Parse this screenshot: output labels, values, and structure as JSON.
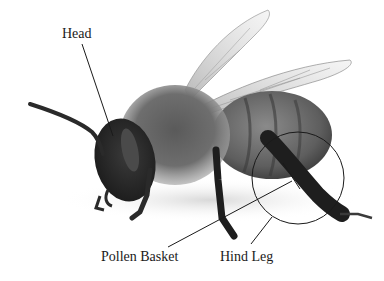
{
  "diagram": {
    "labels": [
      {
        "id": "head",
        "text": "Head"
      },
      {
        "id": "pollen_basket",
        "text": "Pollen Basket"
      },
      {
        "id": "hind_leg",
        "text": "Hind Leg"
      }
    ],
    "callouts": {
      "head": {
        "from": [
          82,
          44
        ],
        "to": [
          113,
          136
        ]
      },
      "pollen_basket": {
        "from": [
          168,
          247
        ],
        "to": [
          292,
          181
        ]
      },
      "hind_leg": {
        "from": [
          251,
          244
        ],
        "to": [
          272,
          217
        ]
      },
      "hind_leg_circle": {
        "cx": 298,
        "cy": 178,
        "r": 46
      }
    },
    "colors": {
      "background": "#ffffff",
      "label_text": "#1a1a1a",
      "line": "#1a1a1a"
    }
  }
}
